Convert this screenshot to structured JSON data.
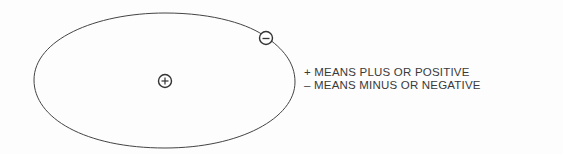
{
  "diagram": {
    "type": "charge-orbit-illustration",
    "positive_charge": {
      "symbol": "+",
      "position": "center"
    },
    "negative_charge": {
      "symbol": "−",
      "position": "on-orbit-upper-right"
    },
    "legend": [
      {
        "symbol": "+",
        "text": "+ MEANS PLUS OR POSITIVE"
      },
      {
        "symbol": "−",
        "text": "– MEANS MINUS OR NEGATIVE"
      }
    ],
    "colors": {
      "line": "#444444",
      "text": "#3a3a3a",
      "background": "#fdfdfd"
    }
  }
}
